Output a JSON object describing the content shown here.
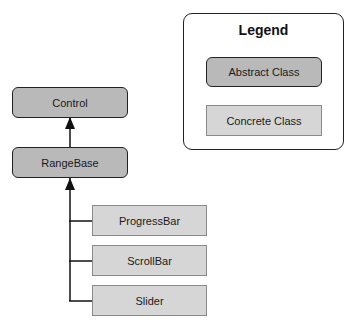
{
  "diagram": {
    "nodes": {
      "control": {
        "label": "Control",
        "kind": "abstract"
      },
      "rangebase": {
        "label": "RangeBase",
        "kind": "abstract"
      },
      "progressbar": {
        "label": "ProgressBar",
        "kind": "concrete"
      },
      "scrollbar": {
        "label": "ScrollBar",
        "kind": "concrete"
      },
      "slider": {
        "label": "Slider",
        "kind": "concrete"
      }
    },
    "edges": [
      {
        "from": "rangebase",
        "to": "control",
        "type": "inheritance"
      },
      {
        "from": "progressbar",
        "to": "rangebase",
        "type": "inheritance"
      },
      {
        "from": "scrollbar",
        "to": "rangebase",
        "type": "inheritance"
      },
      {
        "from": "slider",
        "to": "rangebase",
        "type": "inheritance"
      }
    ]
  },
  "legend": {
    "title": "Legend",
    "items": [
      {
        "label": "Abstract Class",
        "kind": "abstract"
      },
      {
        "label": "Concrete Class",
        "kind": "concrete"
      }
    ]
  },
  "colors": {
    "abstract_fill": "#b9b9b9",
    "concrete_fill": "#d6d6d6",
    "line": "#111111"
  }
}
